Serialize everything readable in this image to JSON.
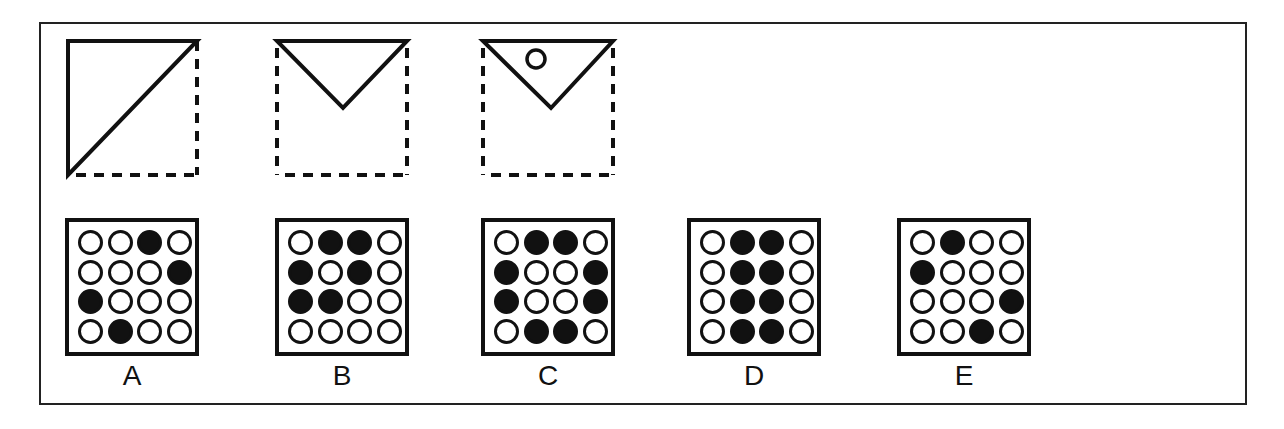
{
  "colors": {
    "ink": "#111111",
    "background": "#ffffff"
  },
  "question": {
    "fold_steps": [
      {
        "id": "step-1",
        "description": "square folded diagonally: top-left half remains (triangle), dashed outline shows folded-away part"
      },
      {
        "id": "step-2",
        "description": "folded again into inverted triangle at top"
      },
      {
        "id": "step-3",
        "description": "inverted triangle with a hole punched",
        "hole": true
      }
    ]
  },
  "options": [
    {
      "label": "A",
      "grid": [
        [
          0,
          0,
          1,
          0
        ],
        [
          0,
          0,
          0,
          1
        ],
        [
          1,
          0,
          0,
          0
        ],
        [
          0,
          1,
          0,
          0
        ]
      ]
    },
    {
      "label": "B",
      "grid": [
        [
          0,
          1,
          1,
          0
        ],
        [
          1,
          0,
          1,
          0
        ],
        [
          1,
          1,
          0,
          0
        ],
        [
          0,
          0,
          0,
          0
        ]
      ]
    },
    {
      "label": "C",
      "grid": [
        [
          0,
          1,
          1,
          0
        ],
        [
          1,
          0,
          0,
          1
        ],
        [
          1,
          0,
          0,
          1
        ],
        [
          0,
          1,
          1,
          0
        ]
      ]
    },
    {
      "label": "D",
      "grid": [
        [
          0,
          1,
          1,
          0
        ],
        [
          0,
          1,
          1,
          0
        ],
        [
          0,
          1,
          1,
          0
        ],
        [
          0,
          1,
          1,
          0
        ]
      ]
    },
    {
      "label": "E",
      "grid": [
        [
          0,
          1,
          0,
          0
        ],
        [
          1,
          0,
          0,
          0
        ],
        [
          0,
          0,
          0,
          1
        ],
        [
          0,
          0,
          1,
          0
        ]
      ]
    }
  ]
}
